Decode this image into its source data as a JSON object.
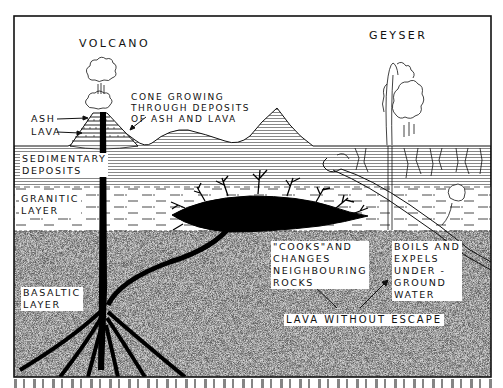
{
  "diagram": {
    "type": "geological cross-section",
    "titles": {
      "volcano": "VOLCANO",
      "geyser": "GEYSER"
    },
    "volcano_labels": {
      "ash": "ASH",
      "lava": "LAVA",
      "cone": "CONE GROWING\nTHROUGH DEPOSITS\nOF ASH AND LAVA"
    },
    "layers": [
      {
        "id": "sedimentary",
        "label": "SEDIMENTARY\nDEPOSITS",
        "fill": "#ffffff",
        "pattern": "horizontal-lines"
      },
      {
        "id": "granitic",
        "label": "GRANITIC\nLAYER",
        "fill": "#ffffff",
        "pattern": "dashes"
      },
      {
        "id": "basaltic",
        "label": "BASALTIC\nLAYER",
        "fill": "#c9c9c9",
        "pattern": "stipple"
      }
    ],
    "annotations": {
      "cooks": "\"COOKS\"AND\nCHANGES\nNEIGHBOURING\nROCKS",
      "boils": "BOILS AND\nEXPELS\nUNDER -\nGROUND\nWATER",
      "lava_without_escape": "LAVA WITHOUT ESCAPE"
    },
    "colors": {
      "ink": "#111111",
      "paper": "#ffffff",
      "basalt": "#c9c9c9",
      "magma": "#000000"
    }
  }
}
